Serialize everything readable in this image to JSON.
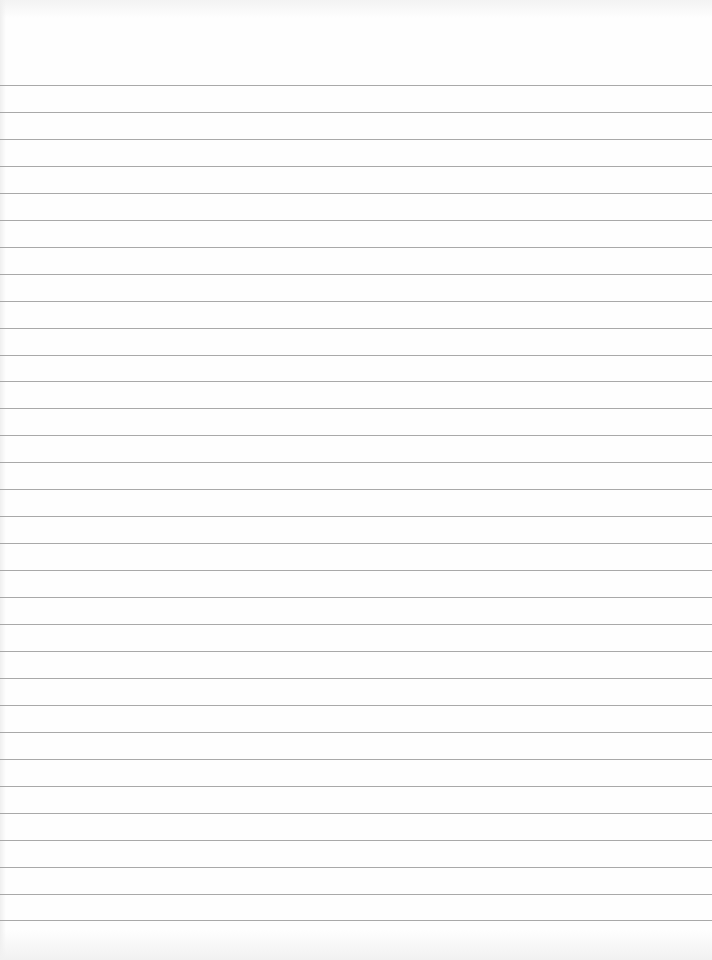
{
  "document": {
    "type": "lined-paper",
    "text": "",
    "rules": {
      "count": 32,
      "first_y": 85,
      "spacing": 26.95,
      "color": "#9a9a9a"
    },
    "background": "#fefefe"
  }
}
